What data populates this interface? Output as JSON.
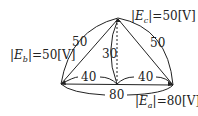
{
  "labels": {
    "ec": {
      "prefix": "|",
      "var": "E",
      "sub": "c",
      "suffix": "|=50[V]"
    },
    "eb": {
      "prefix": "|",
      "var": "E",
      "sub": "b",
      "suffix": "|=50[V]"
    },
    "ea": {
      "prefix": "|",
      "var": "E",
      "sub": "a",
      "suffix": "|=80[V]"
    }
  },
  "lengths": {
    "left_side": "50",
    "right_side": "50",
    "height": "30",
    "left_half": "40",
    "right_half": "40",
    "base": "80"
  },
  "colors": {
    "line": "#222222"
  }
}
